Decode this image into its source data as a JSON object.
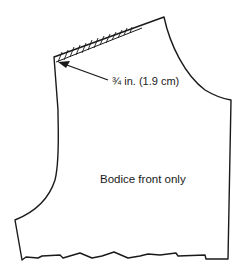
{
  "diagram": {
    "type": "sewing-pattern",
    "subject": "Bodice front",
    "annotations": {
      "measurement_label": "¾ in. (1.9 cm)",
      "piece_label": "Bodice front only"
    },
    "colors": {
      "line": "#1a1a1a",
      "background": "#ffffff"
    }
  }
}
